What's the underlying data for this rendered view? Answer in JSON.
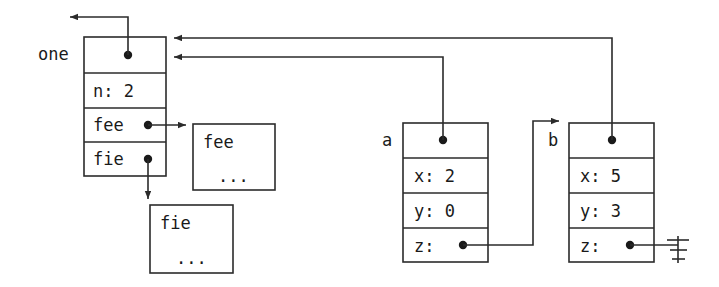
{
  "diagram": {
    "stroke_color": "#2b2b2b",
    "fill_color": "#ffffff",
    "text_color": "#1a1a1a",
    "objects": [
      {
        "id": "one",
        "label": "one",
        "header_slot": "",
        "fields": [
          {
            "name": "n",
            "text": "n: 2"
          },
          {
            "name": "fee",
            "text": "fee"
          },
          {
            "name": "fie",
            "text": "fie"
          }
        ]
      },
      {
        "id": "a",
        "label": "a",
        "header_slot": "",
        "fields": [
          {
            "name": "x",
            "text": "x: 2"
          },
          {
            "name": "y",
            "text": "y: 0"
          },
          {
            "name": "z",
            "text": "z:"
          }
        ]
      },
      {
        "id": "b",
        "label": "b",
        "header_slot": "",
        "fields": [
          {
            "name": "x",
            "text": "x: 5"
          },
          {
            "name": "y",
            "text": "y: 3"
          },
          {
            "name": "z",
            "text": "z:"
          }
        ]
      }
    ],
    "blobs": [
      {
        "id": "fee-blob",
        "title": "fee",
        "body": "..."
      },
      {
        "id": "fie-blob",
        "title": "fie",
        "body": "..."
      }
    ],
    "edges": [
      {
        "id": "one-header-out",
        "from": "one.header",
        "to": "off-left",
        "kind": "arrow-up-left"
      },
      {
        "id": "one-fee-to-fee-blob",
        "from": "one.fee",
        "to": "fee-blob",
        "kind": "arrow-right"
      },
      {
        "id": "one-fie-to-fie-blob",
        "from": "one.fie",
        "to": "fie-blob",
        "kind": "arrow-down"
      },
      {
        "id": "a-header-to-one",
        "from": "a.header",
        "to": "one",
        "kind": "arrow-left"
      },
      {
        "id": "b-header-to-one",
        "from": "b.header",
        "to": "one",
        "kind": "arrow-left"
      },
      {
        "id": "a-z-to-b",
        "from": "a.z",
        "to": "b",
        "kind": "arrow-right"
      },
      {
        "id": "b-z-to-null",
        "from": "b.z",
        "to": "ground",
        "kind": "ground-symbol"
      }
    ]
  }
}
